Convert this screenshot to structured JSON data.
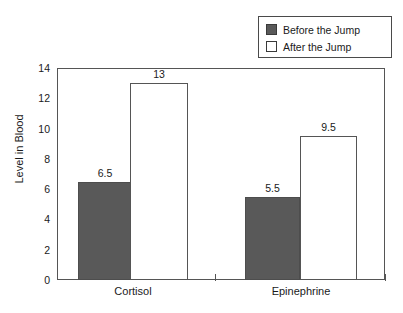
{
  "chart_data": {
    "type": "bar",
    "title": "",
    "subtitle": "",
    "xlabel": "",
    "ylabel": "Level in Blood",
    "categories": [
      "Cortisol",
      "Epinephrine"
    ],
    "series": [
      {
        "name": "Before the Jump",
        "values": [
          6.5,
          5.5
        ],
        "color": "#595959",
        "style": "filled"
      },
      {
        "name": "After the Jump",
        "values": [
          13,
          9.5
        ],
        "color": "#ffffff",
        "style": "hollow"
      }
    ],
    "value_labels": {
      "cortisol_before": "6.5",
      "cortisol_after": "13",
      "epinephrine_before": "5.5",
      "epinephrine_after": "9.5"
    },
    "ylim": [
      0,
      14
    ],
    "ytick_labels": [
      "0",
      "2",
      "4",
      "6",
      "8",
      "10",
      "12",
      "14"
    ],
    "ytick_values": [
      0,
      2,
      4,
      6,
      8,
      10,
      12,
      14
    ],
    "grid": false,
    "legend_position": "top-right",
    "axis_color": "#555555"
  },
  "legend": {
    "entries": [
      {
        "label": "Before the Jump",
        "swatch": "filled-square-icon"
      },
      {
        "label": "After the Jump",
        "swatch": "hollow-square-icon"
      }
    ]
  },
  "axes": {
    "y_label": "Level in Blood",
    "y_ticks": [
      {
        "label": "14",
        "value": 14
      },
      {
        "label": "12",
        "value": 12
      },
      {
        "label": "10",
        "value": 10
      },
      {
        "label": "8",
        "value": 8
      },
      {
        "label": "6",
        "value": 6
      },
      {
        "label": "4",
        "value": 4
      },
      {
        "label": "2",
        "value": 2
      },
      {
        "label": "0",
        "value": 0
      }
    ],
    "x_categories": [
      {
        "label": "Cortisol"
      },
      {
        "label": "Epinephrine"
      }
    ]
  }
}
